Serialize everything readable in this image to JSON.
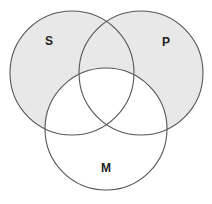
{
  "diagram": {
    "type": "venn-3",
    "colors": {
      "shaded": "#e8e8e8",
      "unshaded": "#ffffff",
      "stroke": "#555555",
      "label": "#222222"
    },
    "circles": [
      {
        "id": "S",
        "label": "S",
        "cx": 72,
        "cy": 73,
        "r": 62,
        "label_x": 49,
        "label_y": 45
      },
      {
        "id": "P",
        "label": "P",
        "cx": 141,
        "cy": 73,
        "r": 62,
        "label_x": 166,
        "label_y": 46
      },
      {
        "id": "M",
        "label": "M",
        "cx": 106,
        "cy": 129,
        "r": 61,
        "label_x": 106,
        "label_y": 172
      }
    ],
    "shading": {
      "shaded_regions": [
        "S only",
        "P only",
        "S and P not M"
      ],
      "unshaded_regions": [
        "M only",
        "S and M not P",
        "P and M not S",
        "S and P and M"
      ]
    }
  }
}
